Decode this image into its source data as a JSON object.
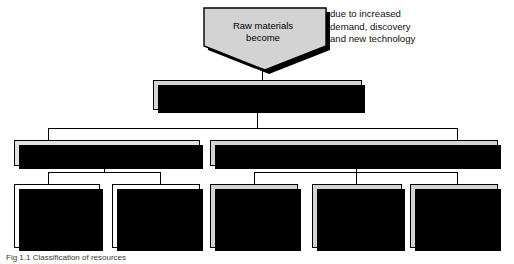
{
  "figure": {
    "caption": "Fig 1.1 Classification of resources"
  },
  "top_node": {
    "label": "Raw materials\nbecome",
    "shape": "pentagon-down",
    "fill": "#d3d3d3"
  },
  "side_note": {
    "text": "due to increased\ndemand, discovery\nand new technology"
  },
  "level2": {
    "label": "Natural resources",
    "fill": "#d6d6d6"
  },
  "level3": [
    {
      "label": "Renewable",
      "fill": "#eeeeee"
    },
    {
      "label": "Non-renewable",
      "fill": "#d3d3d3"
    }
  ],
  "level4": [
    {
      "group": "renewable",
      "title": "Organic",
      "text": "Organic\neg: timber,\ncrops,\nfish,\nlivestock",
      "fill": "#fcfcfc"
    },
    {
      "group": "renewable",
      "title": "Inorganic",
      "text": "Inorganic\neg: water,\nwind,\nsolar energy",
      "fill": "#fcfcfc"
    },
    {
      "group": "non-renewable",
      "title": "Scenic",
      "text": "Scenic\neg: unspoilt\nfjord\nlandscape",
      "fill": "#d3d3d3"
    },
    {
      "group": "non-renewable",
      "title": "Fossil fuels",
      "text": "Fossil fuels\neg: coal, oil,\nnatural gas",
      "fill": "#d3d3d3"
    },
    {
      "group": "non-renewable",
      "title": "Metal ores",
      "text": "Metal ores\neg: iron,\ncopper,\nbauxite",
      "fill": "#d3d3d3"
    }
  ],
  "colors": {
    "line": "#000000",
    "shadow": "#000000",
    "page_background": "#ffffff"
  }
}
